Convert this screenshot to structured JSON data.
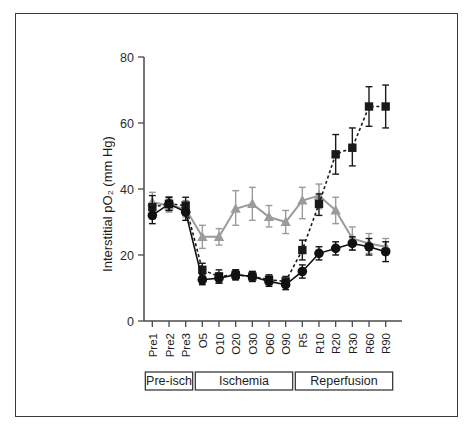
{
  "figure": {
    "border_color": "#3a3a3a",
    "background": "#ffffff"
  },
  "axes": {
    "y_title": "Interstitial pO₂ (mm Hg)",
    "y_title_plain": "Interstitial pO2 (mm Hg)",
    "y_ticks": [
      "0",
      "20",
      "40",
      "60",
      "80"
    ],
    "x_ticks": [
      "Pre1",
      "Pre2",
      "Pre3",
      "O5",
      "O10",
      "O20",
      "O30",
      "O60",
      "O90",
      "R5",
      "R10",
      "R20",
      "R30",
      "R60",
      "R90"
    ]
  },
  "phase_bands": [
    {
      "label": "Pre-isch",
      "start_index": 0,
      "end_index": 2
    },
    {
      "label": "Ischemia",
      "start_index": 3,
      "end_index": 8
    },
    {
      "label": "Reperfusion",
      "start_index": 9,
      "end_index": 14
    }
  ],
  "colors": {
    "series_square": "#1a1a1a",
    "series_circle": "#111111",
    "series_triangle": "#9b9b9b",
    "axis": "#4a4a4a",
    "text": "#1d1d1d"
  },
  "chart_data": {
    "type": "line",
    "title": "",
    "subtitle": "",
    "xlabel": "",
    "ylabel": "Interstitial pO2 (mm Hg)",
    "ylim": [
      0,
      80
    ],
    "yticks": [
      0,
      20,
      40,
      60,
      80
    ],
    "grid": false,
    "legend_position": "none",
    "error_bars": "mean ± SEM",
    "categories": [
      "Pre1",
      "Pre2",
      "Pre3",
      "O5",
      "O10",
      "O20",
      "O30",
      "O60",
      "O90",
      "R5",
      "R10",
      "R20",
      "R30",
      "R60",
      "R90"
    ],
    "series": [
      {
        "name": "square-dashed-series",
        "marker": "square",
        "line_style": "dashed",
        "color": "#1a1a1a",
        "values": [
          34.5,
          35.5,
          35.0,
          15.5,
          13.5,
          14.0,
          13.5,
          12.5,
          12.0,
          21.5,
          35.5,
          50.5,
          52.5,
          65.0,
          65.0
        ],
        "err_low": [
          3.5,
          2.0,
          2.5,
          2.0,
          2.0,
          1.5,
          1.5,
          1.5,
          1.5,
          3.0,
          3.5,
          6.0,
          5.5,
          6.0,
          6.5
        ],
        "err_high": [
          3.5,
          2.0,
          2.5,
          2.0,
          2.0,
          1.5,
          1.5,
          1.5,
          1.5,
          3.0,
          3.0,
          6.0,
          6.0,
          6.0,
          6.5
        ]
      },
      {
        "name": "circle-solid-series",
        "marker": "circle",
        "line_style": "solid",
        "color": "#111111",
        "values": [
          32.0,
          35.5,
          33.0,
          12.5,
          13.0,
          14.0,
          13.5,
          12.0,
          11.0,
          15.0,
          20.5,
          22.0,
          23.5,
          22.5,
          21.0
        ],
        "err_low": [
          2.5,
          2.0,
          2.5,
          1.5,
          1.5,
          1.5,
          1.5,
          1.5,
          1.5,
          2.0,
          2.0,
          2.0,
          2.0,
          2.5,
          3.0
        ],
        "err_high": [
          2.5,
          2.0,
          2.5,
          1.5,
          1.5,
          1.5,
          1.5,
          1.5,
          1.5,
          2.0,
          2.0,
          2.0,
          2.0,
          2.5,
          3.0
        ]
      },
      {
        "name": "triangle-gray-series",
        "marker": "triangle",
        "line_style": "solid",
        "color": "#9b9b9b",
        "values": [
          36.0,
          35.0,
          34.0,
          25.5,
          25.5,
          34.0,
          35.5,
          31.5,
          30.0,
          36.5,
          38.0,
          33.5,
          25.0,
          23.5,
          22.5
        ],
        "err_low": [
          3.0,
          2.0,
          2.5,
          3.5,
          2.5,
          5.0,
          5.0,
          3.0,
          3.5,
          5.5,
          4.0,
          4.0,
          3.5,
          3.0,
          2.5
        ],
        "err_high": [
          3.0,
          2.0,
          2.5,
          3.5,
          2.5,
          5.5,
          5.0,
          3.5,
          3.5,
          4.0,
          3.5,
          4.0,
          3.5,
          3.0,
          2.5
        ]
      }
    ]
  }
}
